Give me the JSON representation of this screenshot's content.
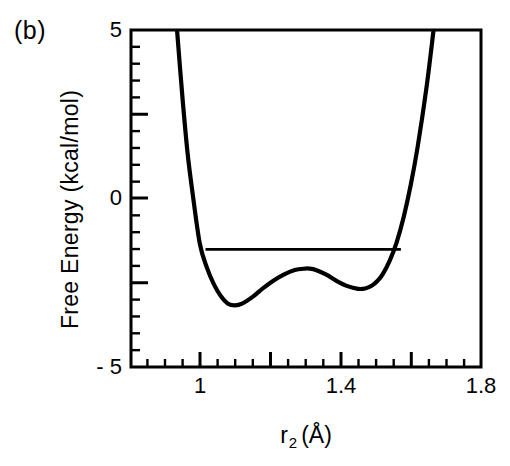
{
  "figure": {
    "panel_label": "(b)",
    "background_color": "#ffffff",
    "line_color": "#000000"
  },
  "chart_data": {
    "type": "line",
    "title": "",
    "panel": "(b)",
    "xlabel": "r_2 (Å)",
    "xlabel_base": "r",
    "xlabel_subscript": "2",
    "xlabel_units": "(Å)",
    "ylabel": "Free Energy  (kcal/mol)",
    "xlim": [
      0.804,
      1.8
    ],
    "ylim": [
      -5,
      5
    ],
    "xticks": [
      1,
      1.4,
      1.8
    ],
    "xtick_labels": [
      "1",
      "1.4",
      "1.8"
    ],
    "yticks": [
      5,
      0,
      -5
    ],
    "ytick_labels": [
      "5",
      "0",
      "- 5"
    ],
    "x_minor_tick_step": 0.05,
    "y_minor_tick_step": 0.5,
    "grid": false,
    "legend": null,
    "series": [
      {
        "name": "free-energy-curve",
        "description": "double-well free energy profile",
        "x": [
          0.935,
          0.95,
          0.965,
          0.98,
          1.0,
          1.02,
          1.04,
          1.06,
          1.08,
          1.1,
          1.12,
          1.15,
          1.18,
          1.21,
          1.24,
          1.27,
          1.3,
          1.31,
          1.33,
          1.36,
          1.39,
          1.42,
          1.45,
          1.47,
          1.49,
          1.505,
          1.52,
          1.54,
          1.56,
          1.58,
          1.6,
          1.62,
          1.645,
          1.665
        ],
        "y": [
          5.0,
          3.05,
          1.35,
          0.1,
          -1.35,
          -2.05,
          -2.55,
          -2.9,
          -3.12,
          -3.17,
          -3.12,
          -2.92,
          -2.66,
          -2.43,
          -2.25,
          -2.12,
          -2.08,
          -2.08,
          -2.12,
          -2.26,
          -2.45,
          -2.6,
          -2.68,
          -2.67,
          -2.58,
          -2.45,
          -2.25,
          -1.85,
          -1.3,
          -0.55,
          0.4,
          1.55,
          3.3,
          5.0
        ],
        "features": {
          "left_minimum": {
            "x": 1.1,
            "y": -3.17
          },
          "barrier_maximum": {
            "x": 1.31,
            "y": -2.08
          },
          "right_minimum": {
            "x": 1.47,
            "y": -2.68
          }
        }
      },
      {
        "name": "tie-line",
        "description": "horizontal level line across the two wells",
        "x": [
          1.016,
          1.572
        ],
        "y": [
          -1.51,
          -1.51
        ]
      }
    ]
  }
}
